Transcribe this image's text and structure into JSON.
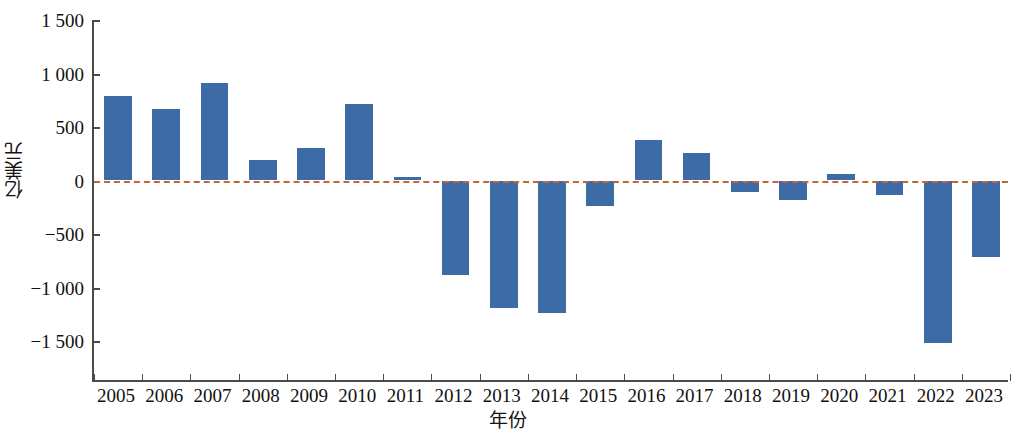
{
  "chart_data": {
    "type": "bar",
    "title": "",
    "subtitle": "",
    "xlabel": "年份",
    "ylabel": "亿美元",
    "categories": [
      "2005",
      "2006",
      "2007",
      "2008",
      "2009",
      "2010",
      "2011",
      "2012",
      "2013",
      "2014",
      "2015",
      "2016",
      "2017",
      "2018",
      "2019",
      "2020",
      "2021",
      "2022",
      "2023"
    ],
    "values": [
      790,
      670,
      915,
      190,
      300,
      715,
      35,
      -885,
      -1190,
      -1240,
      -235,
      380,
      260,
      -110,
      -185,
      65,
      -140,
      -1515,
      -715
    ],
    "series": [
      {
        "name": "",
        "values": [
          790,
          670,
          915,
          190,
          300,
          715,
          35,
          -885,
          -1190,
          -1240,
          -235,
          380,
          260,
          -110,
          -185,
          65,
          -140,
          -1515,
          -715
        ]
      }
    ],
    "ylim": [
      -1500,
      1500
    ],
    "y_ticks": [
      1500,
      1000,
      500,
      0,
      -500,
      -1000,
      -1500
    ],
    "y_tick_labels": [
      "1 500",
      "1 000",
      "500",
      "0",
      "−500",
      "−1 000",
      "−1 500"
    ],
    "grid": false,
    "legend": "none",
    "bar_color": "#3d6ba5",
    "zero_line_color": "#c2653a",
    "zero_line_style": "dashed",
    "axis_color": "#4a4a4a"
  }
}
